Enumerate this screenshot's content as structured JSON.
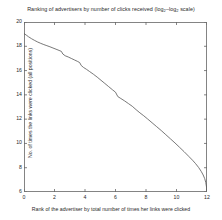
{
  "chart_data": {
    "type": "line",
    "title": "Ranking of advertisers by number of clicks received (log2–log2 scale)",
    "title_parts": {
      "before": "Ranking of advertisers by number of clicks received (log",
      "sub1": "2",
      "middle": "–log",
      "sub2": "2",
      "after": " scale)"
    },
    "xlabel": "Rank of the advertiser by total number of times her links were clicked",
    "ylabel": "No. of times the links were clicked (all positions)",
    "xlim": [
      0,
      12
    ],
    "ylim": [
      6,
      20
    ],
    "xticks": [
      0,
      2,
      4,
      6,
      8,
      10,
      12
    ],
    "xtick_labels": [
      "0",
      "2",
      "4",
      "6",
      "8",
      "10",
      "12"
    ],
    "yticks": [
      6,
      8,
      10,
      12,
      14,
      16,
      18,
      20
    ],
    "ytick_labels": [
      "6",
      "8",
      "10",
      "12",
      "14",
      "16",
      "18",
      "20"
    ],
    "grid": false,
    "legend": null,
    "line_color": "#555555",
    "axis_color": "#666666",
    "background_color": "#ffffff",
    "series": [
      {
        "name": "advertiser click distribution",
        "x": [
          0.0,
          0.15,
          0.3,
          0.5,
          0.7,
          0.9,
          1.1,
          1.3,
          1.5,
          1.7,
          1.9,
          2.1,
          2.3,
          2.45,
          2.55,
          2.7,
          2.9,
          3.1,
          3.3,
          3.5,
          3.65,
          3.75,
          3.9,
          4.1,
          4.3,
          4.55,
          4.8,
          5.05,
          5.3,
          5.55,
          5.8,
          6.0,
          6.15,
          6.35,
          6.6,
          6.85,
          7.1,
          7.35,
          7.6,
          7.85,
          8.1,
          8.4,
          8.7,
          9.0,
          9.3,
          9.6,
          9.9,
          10.2,
          10.5,
          10.8,
          11.05,
          11.25,
          11.45,
          11.62,
          11.75,
          11.85,
          11.92,
          11.97,
          12.0
        ],
        "y": [
          19.05,
          18.92,
          18.78,
          18.62,
          18.48,
          18.35,
          18.24,
          18.14,
          18.05,
          17.96,
          17.86,
          17.76,
          17.66,
          17.58,
          17.36,
          17.22,
          17.12,
          17.0,
          16.88,
          16.76,
          16.66,
          16.42,
          16.26,
          16.1,
          15.92,
          15.7,
          15.46,
          15.2,
          14.94,
          14.68,
          14.42,
          14.22,
          13.86,
          13.7,
          13.5,
          13.28,
          13.06,
          12.78,
          12.52,
          12.28,
          12.02,
          11.7,
          11.38,
          11.06,
          10.72,
          10.38,
          10.04,
          9.68,
          9.32,
          8.94,
          8.62,
          8.34,
          8.02,
          7.7,
          7.4,
          7.1,
          6.78,
          6.4,
          6.02
        ]
      }
    ]
  }
}
